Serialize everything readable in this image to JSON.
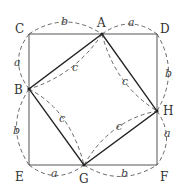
{
  "diagram": {
    "type": "geometry-figure",
    "colors": {
      "solid_line": "#333333",
      "dashed_line": "#555555",
      "text": "#333333"
    },
    "points": {
      "A": {
        "label": "A",
        "x": 102,
        "y": 34
      },
      "B": {
        "label": "B",
        "x": 29,
        "y": 89
      },
      "C": {
        "label": "C",
        "x": 29,
        "y": 34
      },
      "D": {
        "label": "D",
        "x": 157,
        "y": 34
      },
      "E": {
        "label": "E",
        "x": 29,
        "y": 165
      },
      "F": {
        "label": "F",
        "x": 157,
        "y": 165
      },
      "G": {
        "label": "G",
        "x": 84,
        "y": 165
      },
      "H": {
        "label": "H",
        "x": 157,
        "y": 111
      }
    },
    "outer_square": [
      "C",
      "D",
      "F",
      "E"
    ],
    "inner_square": [
      "A",
      "H",
      "G",
      "B"
    ],
    "segment_labels": [
      {
        "segment": "CA",
        "label": "b"
      },
      {
        "segment": "AD",
        "label": "a"
      },
      {
        "segment": "CB",
        "label": "a"
      },
      {
        "segment": "DH",
        "label": "b"
      },
      {
        "segment": "BE",
        "label": "b"
      },
      {
        "segment": "HF",
        "label": "a"
      },
      {
        "segment": "EG",
        "label": "a"
      },
      {
        "segment": "GF",
        "label": "b"
      },
      {
        "segment": "AB",
        "label": "c"
      },
      {
        "segment": "AH",
        "label": "c"
      },
      {
        "segment": "BG",
        "label": "c"
      },
      {
        "segment": "GH",
        "label": "c"
      }
    ]
  }
}
